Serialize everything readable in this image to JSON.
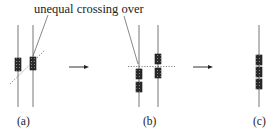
{
  "annotation": {
    "text": "unequal crossing over"
  },
  "panels": [
    {
      "id": "a",
      "label": "(a)",
      "description": "Two homologous chromosomes with gene boxes misaligned; diagonal dashed crossover line"
    },
    {
      "id": "b",
      "label": "(b)",
      "description": "Chromosomes after unequal crossover; horizontal dashed line"
    },
    {
      "id": "c",
      "label": "(c)",
      "description": "Single chromosome with three tandem gene copies"
    }
  ],
  "arrows": [
    {
      "from": "a",
      "to": "b"
    },
    {
      "from": "b",
      "to": "c"
    }
  ],
  "colors": {
    "chromosome": "#777777",
    "gene_box": "#2a2a2a",
    "dashed_line": "#555555",
    "text": "#222222"
  }
}
